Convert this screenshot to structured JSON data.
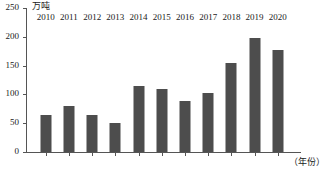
{
  "chart_data": {
    "type": "bar",
    "title": "",
    "subtitle": "",
    "xlabel": "（年份）",
    "ylabel": "万吨",
    "categories": [
      "2010",
      "2011",
      "2012",
      "2013",
      "2014",
      "2015",
      "2016",
      "2017",
      "2018",
      "2019",
      "2020"
    ],
    "values": [
      65,
      80,
      64,
      50,
      115,
      109,
      88,
      103,
      155,
      198,
      177
    ],
    "ylim": [
      0,
      250
    ],
    "yticks": [
      0,
      50,
      100,
      150,
      200,
      250
    ],
    "ytick_labels": [
      "0",
      "50",
      "100",
      "150",
      "200",
      "250"
    ],
    "grid": false,
    "legend": null,
    "bar_color": "#4d4d4d",
    "axis_color": "#555555",
    "text_color": "#1a1a1a",
    "background": "#ffffff"
  }
}
